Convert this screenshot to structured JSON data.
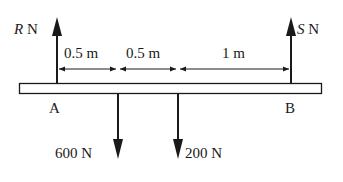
{
  "diagram": {
    "type": "beam-force-diagram",
    "beam": {
      "left_end_label": "A",
      "right_end_label": "B"
    },
    "forces": [
      {
        "id": "R",
        "symbol": "R",
        "unit": "N",
        "direction": "up",
        "position": "A"
      },
      {
        "id": "600",
        "magnitude_label": "600 N",
        "direction": "down"
      },
      {
        "id": "200",
        "magnitude_label": "200 N",
        "direction": "down"
      },
      {
        "id": "S",
        "symbol": "S",
        "unit": "N",
        "direction": "up",
        "position": "B"
      }
    ],
    "dimensions": [
      {
        "label": "0.5 m",
        "from": "A",
        "to": "600 N"
      },
      {
        "label": "0.5 m",
        "from": "600 N",
        "to": "200 N"
      },
      {
        "label": "1 m",
        "from": "200 N",
        "to": "B"
      }
    ],
    "colors": {
      "line": "#1a1a1a",
      "beam_fill": "#ffffff",
      "background": "#ffffff"
    }
  }
}
